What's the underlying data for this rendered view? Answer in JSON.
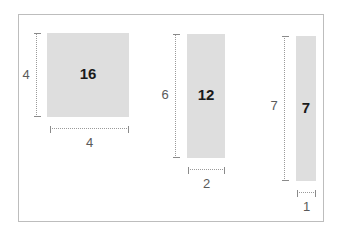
{
  "diagram": {
    "frame_border_color": "#bdbdbd",
    "shape_fill_color": "#dedede",
    "dimension_line_color": "#9a9a9a",
    "area_label_color": "#1a1a1a",
    "dimension_text_color": "#5a5a5a"
  },
  "shapes": [
    {
      "name": "square-4x4",
      "area_label": "16",
      "width_label": "4",
      "height_label": "4",
      "width_units": 4,
      "height_units": 4,
      "area_units": 16
    },
    {
      "name": "rectangle-2x6",
      "area_label": "12",
      "width_label": "2",
      "height_label": "6",
      "width_units": 2,
      "height_units": 6,
      "area_units": 12
    },
    {
      "name": "rectangle-1x7",
      "area_label": "7",
      "width_label": "1",
      "height_label": "7",
      "width_units": 1,
      "height_units": 7,
      "area_units": 7
    }
  ]
}
